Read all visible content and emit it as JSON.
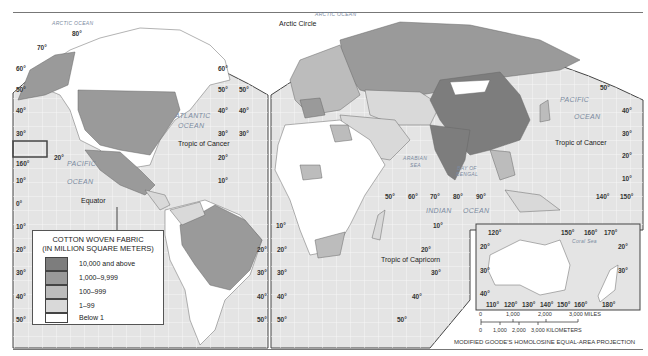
{
  "map": {
    "title": "Cotton Woven Fabric Production",
    "projection": "MODIFIED GOODE'S HOMOLOSINE EQUAL-AREA PROJECTION",
    "colors": {
      "ocean": "#e6e6e6",
      "gridline": "#f7f7f7",
      "border": "#555555",
      "tier_10000_plus": "#7d7d7d",
      "tier_1000_9999": "#9a9a9a",
      "tier_100_999": "#bcbcbc",
      "tier_1_99": "#d9d9d9",
      "tier_below_1": "#ffffff"
    },
    "labels": {
      "arctic_ocean_west": "ARCTIC OCEAN",
      "arctic_ocean_east": "ARCTIC OCEAN",
      "arctic_circle": "Arctic Circle",
      "atlantic_1": "ATLANTIC",
      "atlantic_2": "OCEAN",
      "pacific_w_1": "PACIFIC",
      "pacific_w_2": "OCEAN",
      "pacific_e_1": "PACIFIC",
      "pacific_e_2": "OCEAN",
      "tropic_cancer_w": "Tropic of Cancer",
      "tropic_cancer_e": "Tropic of Cancer",
      "equator": "Equator",
      "tropic_capricorn": "Tropic of Capricorn",
      "arabian_sea_1": "ARABIAN",
      "arabian_sea_2": "SEA",
      "bay_bengal_1": "BAY OF",
      "bay_bengal_2": "BENGAL",
      "indian_1": "INDIAN",
      "indian_2": "OCEAN",
      "coral_sea": "Coral Sea"
    },
    "degrees": {
      "d80n": "80°",
      "d70": "70°",
      "d60": "60°",
      "d50": "50°",
      "d40": "40°",
      "d30": "30°",
      "d20": "20°",
      "d10": "10°",
      "d0": "0°",
      "d160": "160°",
      "d50e": "50°",
      "d60e": "60°",
      "d70e": "70°",
      "d80e": "80°",
      "d90e": "90°",
      "d140e": "140°",
      "d150e": "150°",
      "a120": "120°",
      "a150": "150°",
      "a160": "160°",
      "a170": "170°",
      "a110": "110°",
      "a130": "130°",
      "a140": "140°",
      "a180": "180°"
    }
  },
  "legend": {
    "title_line1": "COTTON WOVEN FABRIC",
    "title_line2": "(IN MILLION SQUARE METERS)",
    "items": [
      {
        "label": "10,000 and above",
        "color": "#7d7d7d"
      },
      {
        "label": "1,000–9,999",
        "color": "#9a9a9a"
      },
      {
        "label": "100–999",
        "color": "#bcbcbc"
      },
      {
        "label": "1–99",
        "color": "#d9d9d9"
      },
      {
        "label": "Below 1",
        "color": "#ffffff"
      }
    ]
  },
  "scale_bar": {
    "miles_ticks": [
      "0",
      "1,000",
      "2,000",
      "3,000 MILES"
    ],
    "km_ticks": [
      "0",
      "1,000",
      "2,000",
      "3,000 KILOMETERS"
    ]
  }
}
